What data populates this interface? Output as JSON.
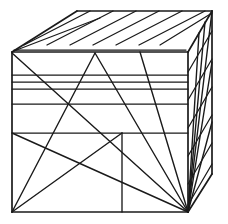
{
  "figure": {
    "type": "line-drawing",
    "background_color": "#ffffff",
    "line_color": "#1a1a1a",
    "canvas": {
      "width": 228,
      "height": 224
    }
  },
  "geometry": {
    "vertices": {
      "front_top_left": [
        12,
        52
      ],
      "front_top_right": [
        188,
        52
      ],
      "front_bottom_left": [
        12,
        212
      ],
      "front_bottom_right": [
        188,
        212
      ],
      "back_top_left": [
        77,
        11
      ],
      "back_top_right": [
        212,
        11
      ],
      "back_bottom_right": [
        212,
        174
      ]
    },
    "faces": [
      {
        "name": "top-face",
        "kind": "parallelogram",
        "points": "12,52 77,11 212,11 188,52"
      },
      {
        "name": "front-face",
        "kind": "rectangle",
        "points": "12,52 188,52 188,212 12,212"
      },
      {
        "name": "right-face",
        "kind": "parallelogram",
        "points": "188,52 212,11 212,174 188,212"
      }
    ],
    "top_face_hatch_lines": [
      [
        24,
        45,
        90,
        11
      ],
      [
        47,
        45,
        113,
        11
      ],
      [
        70,
        45,
        136,
        11
      ],
      [
        93,
        45,
        159,
        11
      ],
      [
        116,
        45,
        182,
        11
      ],
      [
        139,
        45,
        205,
        11
      ],
      [
        160,
        45,
        212,
        13
      ],
      [
        14,
        50,
        188,
        50
      ],
      [
        14,
        51,
        96,
        19
      ]
    ],
    "front_face_band_lines": [
      {
        "name": "band-1",
        "y": 75
      },
      {
        "name": "band-2",
        "y": 82
      },
      {
        "name": "band-3",
        "y": 89
      },
      {
        "name": "band-4",
        "y": 104
      },
      {
        "name": "band-5",
        "y": 133
      }
    ],
    "front_face_diagonals": [
      {
        "name": "apex-left-leg",
        "points": [
          95,
          53,
          12,
          212
        ]
      },
      {
        "name": "apex-right-leg",
        "points": [
          95,
          53,
          188,
          212
        ]
      },
      {
        "name": "corner-diagonal-tl-br",
        "points": [
          12,
          53,
          188,
          212
        ]
      },
      {
        "name": "lower-diagonal-bl-br",
        "points": [
          12,
          133,
          188,
          212
        ]
      },
      {
        "name": "lower-left-diagonal",
        "points": [
          12,
          212,
          122,
          133
        ]
      },
      {
        "name": "steep-right-diagonal",
        "points": [
          140,
          52,
          188,
          212
        ]
      }
    ],
    "front_face_divider": {
      "name": "lower-panel-divider",
      "points": [
        122,
        133,
        122,
        212
      ],
      "horizontal": [
        12,
        133,
        188,
        133
      ]
    },
    "right_face_hatch_lines": [
      [
        188,
        72,
        212,
        31
      ],
      [
        188,
        100,
        212,
        59
      ],
      [
        188,
        128,
        212,
        87
      ],
      [
        188,
        156,
        212,
        115
      ],
      [
        188,
        184,
        212,
        143
      ],
      [
        188,
        205,
        212,
        164
      ]
    ],
    "right_face_converging_lines": [
      [
        212,
        11,
        188,
        212
      ],
      [
        200,
        31,
        188,
        212
      ],
      [
        205,
        22,
        188,
        212
      ],
      [
        212,
        60,
        188,
        212
      ],
      [
        212,
        120,
        188,
        212
      ],
      [
        212,
        174,
        188,
        212
      ]
    ]
  }
}
